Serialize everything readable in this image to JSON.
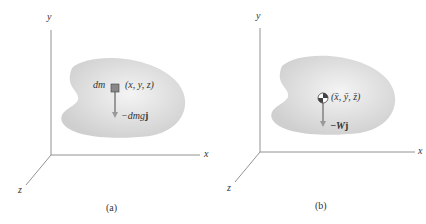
{
  "panels": [
    {
      "caption": "(a)",
      "axes": {
        "x": "x",
        "y": "y",
        "z": "z"
      },
      "element_label": "dm",
      "point_label": "(x, y, z)",
      "force_label": "−dmg",
      "force_unit": "j"
    },
    {
      "caption": "(b)",
      "axes": {
        "x": "x",
        "y": "y",
        "z": "z"
      },
      "point_label": "(x̄, ȳ, z̄)",
      "force_label": "−W",
      "force_unit": "j"
    }
  ],
  "colors": {
    "axis": "#666666",
    "body": "#d6d6d6",
    "arrow": "#9a9a9a"
  }
}
